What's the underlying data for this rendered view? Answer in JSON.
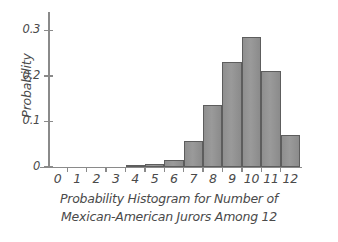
{
  "chart_data": {
    "type": "bar",
    "title": "Probability Histogram for Number of Mexican-American Jurors Among 12",
    "title_line1": "Probability Histogram for Number of",
    "title_line2": "Mexican-American Jurors Among 12",
    "xlabel": "",
    "ylabel": "Probability",
    "categories": [
      "0",
      "1",
      "2",
      "3",
      "4",
      "5",
      "6",
      "7",
      "8",
      "9",
      "10",
      "11",
      "12"
    ],
    "values": [
      0,
      0,
      0,
      0.001,
      0.003,
      0.006,
      0.016,
      0.056,
      0.135,
      0.23,
      0.285,
      0.21,
      0.07
    ],
    "ylim": [
      0,
      0.34
    ],
    "xlim": [
      -0.5,
      12.5
    ],
    "ytick_labels": [
      "0",
      "0.1",
      "0.2",
      "0.3"
    ],
    "ytick_values": [
      0,
      0.1,
      0.2,
      0.3
    ],
    "xtick_labels": [
      "0",
      "1",
      "2",
      "3",
      "4",
      "5",
      "6",
      "7",
      "8",
      "9",
      "10",
      "11",
      "12"
    ],
    "grid": false,
    "legend": null,
    "bar_fill_color": "#949494",
    "bar_edge_color": "#5d5d5d",
    "axis_color": "#8a8a8a",
    "text_color": "#4a4a4a"
  }
}
